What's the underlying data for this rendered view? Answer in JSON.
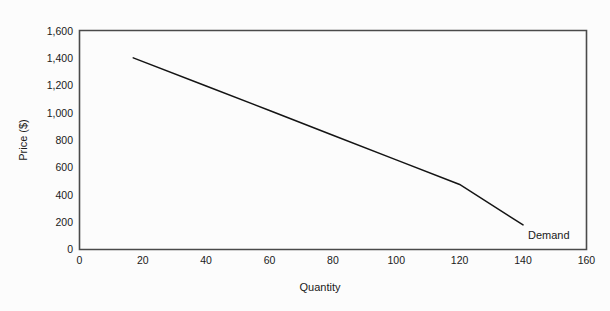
{
  "chart_data": {
    "type": "line",
    "title": "",
    "subtitle": "",
    "xlabel": "Quantity",
    "ylabel": "Price ($)",
    "xlim": [
      0,
      160
    ],
    "ylim": [
      0,
      1600
    ],
    "grid": false,
    "legend_position": "inline-right-end",
    "x_ticks": [
      0,
      20,
      40,
      60,
      80,
      100,
      120,
      140,
      160
    ],
    "x_tick_labels": [
      "0",
      "20",
      "40",
      "60",
      "80",
      "100",
      "120",
      "140",
      "160"
    ],
    "y_ticks": [
      0,
      200,
      400,
      600,
      800,
      1000,
      1200,
      1400,
      1600
    ],
    "y_tick_labels": [
      "0",
      "200",
      "400",
      "600",
      "800",
      "1,000",
      "1,200",
      "1,400",
      "1,600"
    ],
    "series": [
      {
        "name": "Demand",
        "color": "#141414",
        "annotation": "Demand",
        "x": [
          17,
          140
        ],
        "values": [
          1400,
          180
        ],
        "points": [
          {
            "x": 17,
            "y": 1400
          },
          {
            "x": 40,
            "y": 1195
          },
          {
            "x": 60,
            "y": 1015
          },
          {
            "x": 80,
            "y": 835
          },
          {
            "x": 100,
            "y": 655
          },
          {
            "x": 120,
            "y": 475
          },
          {
            "x": 140,
            "y": 180
          }
        ]
      }
    ],
    "annotations": [
      {
        "text": "Demand",
        "x": 143,
        "y": 120
      }
    ]
  },
  "axes": {
    "x_title": "Quantity",
    "y_title": "Price ($)"
  },
  "colors": {
    "background": "#fcfcfc",
    "frame": "#4a4a4a",
    "line": "#141414",
    "text": "#1a1a1a"
  }
}
